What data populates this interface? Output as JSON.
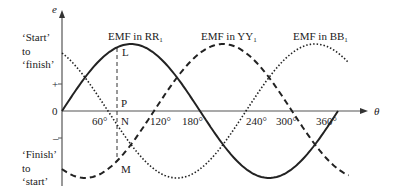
{
  "diagram": {
    "axis": {
      "y_label": "e",
      "x_label": "θ",
      "origin_label": "0",
      "plus_label": "+",
      "minus_label": "–",
      "ticks": [
        "60°",
        "120°",
        "180°",
        "240°",
        "300°",
        "360°"
      ]
    },
    "side_labels": {
      "top": [
        "‘Start’",
        "to",
        "‘finish’"
      ],
      "bottom": [
        "‘Finish’",
        "to",
        "‘start’"
      ]
    },
    "curves": [
      {
        "name": "EMF in RR",
        "sub": "1",
        "style": "solid",
        "phase_deg": 0
      },
      {
        "name": "EMF in YY",
        "sub": "1",
        "style": "dashed",
        "phase_deg": -120
      },
      {
        "name": "EMF in BB",
        "sub": "1",
        "style": "dotted",
        "phase_deg": -240
      }
    ],
    "points": {
      "L": "L",
      "P": "P",
      "N": "N",
      "M": "M"
    }
  }
}
